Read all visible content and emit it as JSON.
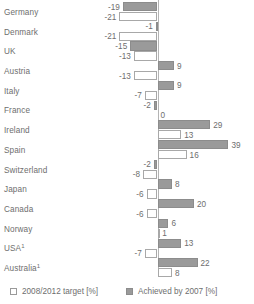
{
  "chart_data": {
    "type": "bar",
    "title": "",
    "subtitle": "",
    "xlabel": "",
    "ylabel": "",
    "orientation": "horizontal",
    "grid": false,
    "legend_position": "bottom",
    "xlim": [
      -25,
      43
    ],
    "zero_line": true,
    "categories": [
      "Germany",
      "Denmark",
      "UK",
      "Austria",
      "Italy",
      "France",
      "Ireland",
      "Spain",
      "Switzerland",
      "Japan",
      "Canada",
      "Norway",
      "USA",
      "Australia"
    ],
    "category_footnotes": {
      "USA": "1",
      "Australia": "1"
    },
    "series": [
      {
        "name": "Achieved by 2007 [%]",
        "color": "#9a9a9a",
        "values": [
          -19,
          -1,
          -15,
          9,
          9,
          -2,
          29,
          39,
          -2,
          8,
          20,
          6,
          13,
          22
        ]
      },
      {
        "name": "2008/2012 target [%]",
        "color": "#ffffff",
        "values": [
          -21,
          -21,
          -13,
          -13,
          -7,
          0,
          13,
          16,
          -8,
          -6,
          -6,
          1,
          -7,
          8
        ]
      }
    ]
  },
  "legend": {
    "items": [
      {
        "label": "2008/2012 target [%]",
        "swatch": "target-swatch"
      },
      {
        "label": "Achieved by 2007 [%]",
        "swatch": "achieved-swatch"
      }
    ]
  },
  "colors": {
    "achieved_fill": "#9a9a9a",
    "achieved_stroke": "#8c8c8c",
    "target_fill": "#ffffff",
    "target_stroke": "#a8a8a8",
    "text": "#6e6e6e",
    "axis": "#b4b4b4",
    "background": "#ffffff"
  }
}
